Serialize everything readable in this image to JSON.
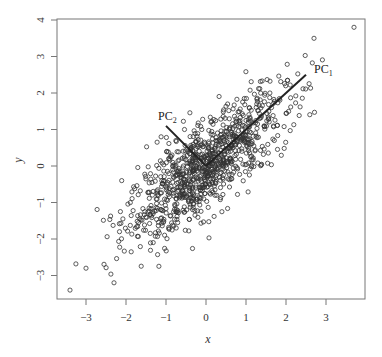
{
  "chart_data": {
    "type": "scatter",
    "title": "",
    "xlabel": "x",
    "ylabel": "y",
    "xlim": [
      -3.6,
      3.95
    ],
    "ylim": [
      -3.6,
      4.0
    ],
    "x_ticks": [
      -3,
      -2,
      -1,
      0,
      1,
      2,
      3
    ],
    "y_ticks": [
      -3,
      -2,
      -1,
      0,
      1,
      2,
      3,
      4
    ],
    "x_tick_labels": [
      "−3",
      "−2",
      "−1",
      "0",
      "1",
      "2",
      "3"
    ],
    "y_tick_labels": [
      "−3",
      "−2",
      "−1",
      "0",
      "1",
      "2",
      "3",
      "4"
    ],
    "grid": false,
    "legend": null,
    "series": [
      {
        "name": "observations",
        "marker": "open-circle",
        "n_points_approx": 1000,
        "distribution": "bivariate normal, mean (0,0), sd_x≈1, sd_y≈1, correlation≈0.8",
        "notable_points": [
          {
            "x": 3.7,
            "y": 3.8
          },
          {
            "x": 2.7,
            "y": 3.5
          },
          {
            "x": -3.4,
            "y": -3.4
          },
          {
            "x": -3.0,
            "y": -2.8
          },
          {
            "x": -2.3,
            "y": -3.2
          }
        ]
      }
    ],
    "annotations": [
      {
        "label": "PC",
        "subscript": "1",
        "type": "line",
        "from": [
          0,
          0
        ],
        "to": [
          2.5,
          2.5
        ],
        "text_pos": [
          2.6,
          2.6
        ]
      },
      {
        "label": "PC",
        "subscript": "2",
        "type": "line",
        "from": [
          0,
          0
        ],
        "to": [
          -1.0,
          1.1
        ],
        "text_pos": [
          -1.1,
          1.25
        ]
      }
    ]
  },
  "axes": {
    "x_label": "x",
    "y_label": "y"
  },
  "annotations": {
    "pc1": {
      "main": "PC",
      "sub": "1"
    },
    "pc2": {
      "main": "PC",
      "sub": "2"
    }
  }
}
